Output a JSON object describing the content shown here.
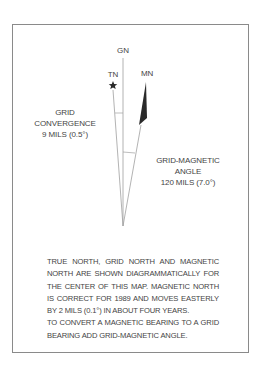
{
  "diagram": {
    "labels": {
      "grid_north": "GN",
      "true_north": "TN",
      "magnetic_north": "MN"
    },
    "grid_convergence": {
      "title_line1": "GRID",
      "title_line2": "CONVERGENCE",
      "value": "9 MILS (0.5°)"
    },
    "grid_magnetic_angle": {
      "title_line1": "GRID-MAGNETIC",
      "title_line2": "ANGLE",
      "value": "120 MILS (7.0°)"
    },
    "colors": {
      "frame": "#8a8a8a",
      "lines": "#9a9a9a",
      "arrow": "#2a2a2a"
    }
  },
  "notes": {
    "paragraph1": "TRUE NORTH, GRID NORTH AND MAGNETIC NORTH ARE SHOWN DIAGRAMMATICALLY FOR THE CENTER OF THIS MAP. MAGNETIC NORTH IS CORRECT FOR 1989 AND MOVES EASTERLY BY 2 MILS (0.1°) IN ABOUT FOUR YEARS.",
    "paragraph2": "TO CONVERT A MAGNETIC BEARING TO A GRID BEARING ADD GRID-MAGNETIC ANGLE."
  }
}
